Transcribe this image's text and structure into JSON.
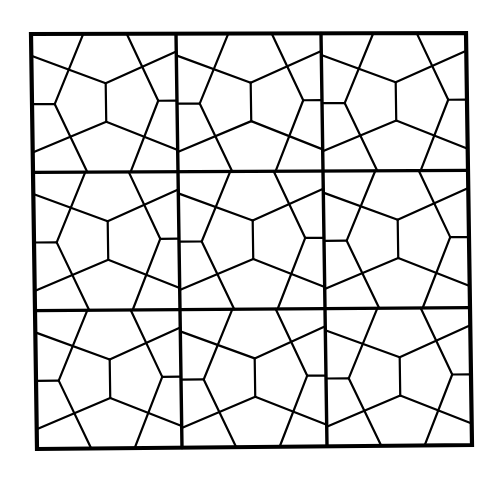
{
  "figure": {
    "title": "Pentagonal tiling on a 3x3 grid",
    "width": 492,
    "height": 477,
    "background": "#ffffff",
    "ink": "#000000",
    "rows": 3,
    "cols": 3,
    "outer_corners": {
      "top_left": [
        31,
        34
      ],
      "top_right": [
        466,
        33
      ],
      "bottom_right": [
        472,
        445
      ],
      "bottom_left": [
        37,
        449
      ]
    },
    "stroke": {
      "outer": 4.2,
      "grid": 3.4,
      "tile": 2.2
    },
    "cell_unit": {
      "w": 147,
      "h": 140
    },
    "cell_segments": [
      [
        [
          0,
          22
        ],
        [
          75,
          50
        ]
      ],
      [
        [
          75,
          50
        ],
        [
          147,
          18
        ]
      ],
      [
        [
          0,
          120
        ],
        [
          75,
          89
        ]
      ],
      [
        [
          75,
          89
        ],
        [
          147,
          118
        ]
      ],
      [
        [
          75,
          50
        ],
        [
          75,
          89
        ]
      ],
      [
        [
          53,
          0
        ],
        [
          23,
          71
        ]
      ],
      [
        [
          23,
          71
        ],
        [
          55,
          140
        ]
      ],
      [
        [
          97,
          0
        ],
        [
          128,
          68
        ]
      ],
      [
        [
          128,
          68
        ],
        [
          99,
          140
        ]
      ],
      [
        [
          0,
          71
        ],
        [
          23,
          71
        ]
      ],
      [
        [
          128,
          68
        ],
        [
          147,
          68
        ]
      ]
    ]
  }
}
